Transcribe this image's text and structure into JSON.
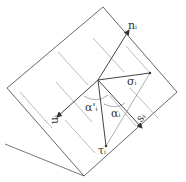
{
  "diagram": {
    "labels": {
      "n": "n",
      "n_sub": "i",
      "u": "u",
      "u_sub": "i",
      "s": "s",
      "s_sub": "i",
      "sigma": "σ",
      "sigma_sub": "i",
      "tau": "τ",
      "tau_sub": "i",
      "alpha_prime": "α'",
      "alpha_prime_sub": "i",
      "alpha": "α",
      "alpha_sub": "i"
    },
    "colors": {
      "line": "#444444",
      "hatch": "#aaaaaa",
      "bg": "#ffffff"
    }
  }
}
